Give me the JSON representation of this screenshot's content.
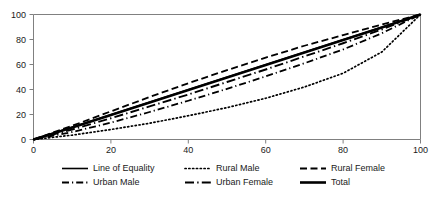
{
  "chart_data": {
    "type": "line",
    "title": "",
    "subtitle": "",
    "xlabel": "",
    "ylabel": "",
    "xlim": [
      0,
      100
    ],
    "ylim": [
      0,
      100
    ],
    "grid": false,
    "legend_position": "bottom",
    "legend_columns": 3,
    "x_ticks": [
      "0",
      "20",
      "40",
      "60",
      "80",
      "100"
    ],
    "y_ticks": [
      "0",
      "20",
      "40",
      "60",
      "80",
      "100"
    ],
    "x_tick_values": [
      0,
      20,
      40,
      60,
      80,
      100
    ],
    "y_tick_values": [
      0,
      20,
      40,
      60,
      80,
      100
    ],
    "x": [
      0,
      10,
      20,
      30,
      40,
      50,
      60,
      70,
      80,
      90,
      100
    ],
    "series": [
      {
        "name": "Line of Equality",
        "style": "solid",
        "values": [
          0,
          10,
          20,
          30,
          40,
          50,
          60,
          70,
          80,
          90,
          100
        ]
      },
      {
        "name": "Rural Male",
        "style": "dotted",
        "values": [
          0,
          3.5,
          8,
          13,
          19,
          25.5,
          33,
          42,
          53,
          70,
          100
        ]
      },
      {
        "name": "Rural Female",
        "style": "dashed",
        "values": [
          0,
          11,
          22.5,
          34,
          45,
          55.5,
          65.5,
          75,
          83.5,
          92,
          100
        ]
      },
      {
        "name": "Urban Male",
        "style": "dash-dot",
        "values": [
          0,
          6,
          13.5,
          22,
          31,
          40.5,
          50.5,
          61,
          72,
          85,
          100
        ]
      },
      {
        "name": "Urban Female",
        "style": "long-dash-dot",
        "values": [
          0,
          8,
          17,
          26.5,
          36,
          46,
          56,
          66.5,
          77,
          88,
          100
        ]
      },
      {
        "name": "Total",
        "style": "thick-solid",
        "values": [
          0,
          9.5,
          19.5,
          29.5,
          39.5,
          49.5,
          59.5,
          69.5,
          79.5,
          89.5,
          100
        ]
      }
    ]
  },
  "legend": {
    "entries": [
      {
        "label": "Line of Equality",
        "style": "solid"
      },
      {
        "label": "Rural Male",
        "style": "dotted"
      },
      {
        "label": "Rural Female",
        "style": "dashed"
      },
      {
        "label": "Urban Male",
        "style": "dash-dot"
      },
      {
        "label": "Urban Female",
        "style": "long-dash-dot"
      },
      {
        "label": "Total",
        "style": "thick-solid"
      }
    ]
  },
  "colors": {
    "series": "#000000",
    "axis": "#808080",
    "text": "#1a1a1a",
    "background": "#ffffff"
  }
}
